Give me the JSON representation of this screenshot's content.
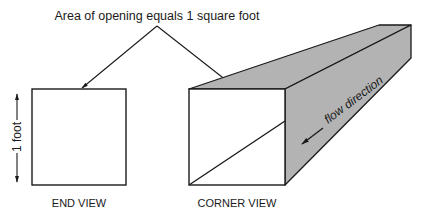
{
  "title": "Area of opening equals 1 square foot",
  "end_view": {
    "label": "END VIEW",
    "dimension_label": "1 foot"
  },
  "corner_view": {
    "label": "CORNER VIEW",
    "flow_label": "flow direction"
  },
  "colors": {
    "line": "#1a1a1a",
    "duct_face": "#b3b3b3",
    "opening": "#ffffff"
  }
}
